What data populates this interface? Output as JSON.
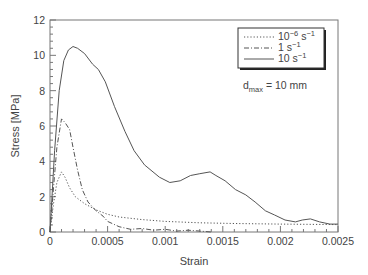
{
  "chart_data": {
    "type": "line",
    "title": "",
    "xlabel": "Strain",
    "ylabel": "Stress [MPa]",
    "xlim": [
      0,
      0.0025
    ],
    "ylim": [
      0,
      12
    ],
    "x_ticks": [
      "0",
      "0.0005",
      "0.001",
      "0.0015",
      "0.002",
      "0.0025"
    ],
    "x_tick_values": [
      0,
      0.0005,
      0.001,
      0.0015,
      0.002,
      0.0025
    ],
    "y_ticks": [
      "0",
      "2",
      "4",
      "6",
      "8",
      "10",
      "12"
    ],
    "y_tick_values": [
      0,
      2,
      4,
      6,
      8,
      10,
      12
    ],
    "grid": false,
    "legend_position": "upper right",
    "annotation": {
      "main": "d",
      "sub": "max",
      "rest": " = 10 mm"
    },
    "series": [
      {
        "name": "10^-6 s^-1",
        "label_base": "10",
        "label_exp": "−6",
        "label_unit": " s",
        "label_unit_exp": "−1",
        "style": "dotted",
        "x": [
          0,
          3e-05,
          6e-05,
          0.0001,
          0.00013,
          0.00017,
          0.00022,
          0.0003,
          0.0004,
          0.0005,
          0.0006,
          0.0008,
          0.001,
          0.0013,
          0.0016,
          0.002,
          0.0025
        ],
        "y": [
          0,
          1.6,
          2.8,
          3.4,
          3.1,
          2.5,
          2.0,
          1.6,
          1.25,
          1.0,
          0.85,
          0.7,
          0.6,
          0.52,
          0.48,
          0.45,
          0.42
        ]
      },
      {
        "name": "1 s^-1",
        "label_base": "1",
        "label_exp": "",
        "label_unit": " s",
        "label_unit_exp": "−1",
        "style": "dash-dot",
        "x": [
          0,
          3e-05,
          6e-05,
          0.0001,
          0.00013,
          0.00017,
          0.0002,
          0.00024,
          0.00028,
          0.00033,
          0.0004,
          0.00046,
          0.0005,
          0.0006,
          0.0007,
          0.0008,
          0.0009,
          0.001,
          0.0011,
          0.0012,
          0.0013,
          0.0014
        ],
        "y": [
          0,
          2.5,
          4.8,
          6.4,
          6.2,
          5.8,
          4.8,
          3.5,
          2.4,
          1.7,
          1.2,
          0.9,
          0.6,
          0.3,
          0.15,
          0.2,
          0.1,
          0.15,
          0.05,
          0.1,
          0.05,
          0
        ]
      },
      {
        "name": "10 s^-1",
        "label_base": "10",
        "label_exp": "",
        "label_unit": " s",
        "label_unit_exp": "−1",
        "style": "solid",
        "x": [
          0,
          4e-05,
          8e-05,
          0.00012,
          0.00016,
          0.0002,
          0.00024,
          0.0003,
          0.00037,
          0.00042,
          0.00048,
          0.00056,
          0.00065,
          0.00073,
          0.00082,
          0.00095,
          0.00104,
          0.00113,
          0.00122,
          0.0013,
          0.00139,
          0.00144,
          0.00152,
          0.00161,
          0.0017,
          0.00178,
          0.00187,
          0.00195,
          0.00204,
          0.00213,
          0.00219,
          0.00226,
          0.00234,
          0.00243,
          0.0025
        ],
        "y": [
          0,
          4.6,
          8.0,
          9.7,
          10.3,
          10.5,
          10.4,
          10.1,
          9.5,
          9.2,
          8.5,
          7.1,
          5.7,
          4.6,
          3.8,
          3.1,
          2.8,
          2.9,
          3.2,
          3.3,
          3.4,
          3.2,
          2.9,
          2.4,
          2.1,
          1.7,
          1.2,
          0.96,
          0.68,
          0.57,
          0.68,
          0.74,
          0.57,
          0.45,
          0.45
        ]
      }
    ]
  }
}
